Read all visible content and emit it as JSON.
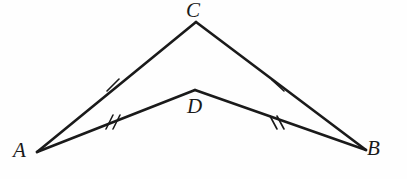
{
  "figure": {
    "background_color": "#fefefe",
    "stroke_color": "#1a1a1a",
    "labels": {
      "A": "A",
      "B": "B",
      "C": "C",
      "D": "D"
    },
    "vertices": {
      "A": {
        "x": 37,
        "y": 152
      },
      "B": {
        "x": 366,
        "y": 150
      },
      "C": {
        "x": 196,
        "y": 22
      },
      "D": {
        "x": 195,
        "y": 90
      }
    },
    "segments": [
      {
        "name": "AC",
        "from": "A",
        "to": "C",
        "tick_count": 1
      },
      {
        "name": "CB",
        "from": "C",
        "to": "B",
        "tick_count": 1
      },
      {
        "name": "AD",
        "from": "A",
        "to": "D",
        "tick_count": 2
      },
      {
        "name": "DB",
        "from": "D",
        "to": "B",
        "tick_count": 2
      }
    ],
    "tick_marks": [
      {
        "segment": "AC",
        "count": 1,
        "x": 113,
        "y": 85
      },
      {
        "segment": "CB",
        "count": 1,
        "x": 278,
        "y": 85
      },
      {
        "segment": "AD",
        "count": 2,
        "x": 113,
        "y": 122
      },
      {
        "segment": "DB",
        "count": 2,
        "x": 277,
        "y": 122
      }
    ]
  }
}
